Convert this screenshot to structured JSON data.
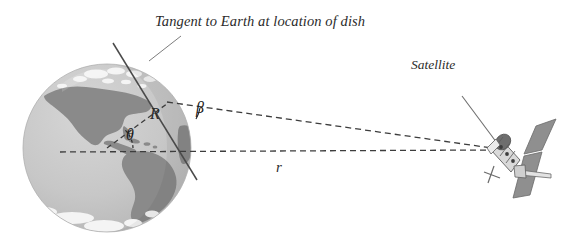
{
  "figure": {
    "kind": "geometry-diagram",
    "background_color": "#ffffff"
  },
  "labels": {
    "title": "Tangent to Earth at location of dish",
    "satellite": "Satellite",
    "angle_beta": "β",
    "angle_theta": "θ",
    "radius_R": "R",
    "distance_r": "r"
  },
  "colors": {
    "ocean": "#c9c9c9",
    "ocean_shade": "#bdbdbd",
    "land": "#8a8a8a",
    "ice": "#f2f2f2",
    "line": "#4a4a4a",
    "dashed": "#4a4a4a",
    "text": "#2b2b2b",
    "satellite_body": "#d8d8d8",
    "satellite_panel": "#8f8f8f",
    "satellite_dark": "#6e6e6e"
  },
  "geometry": {
    "earth_center": [
      107,
      148
    ],
    "earth_radius_px": 84,
    "dish_point": [
      168,
      103
    ],
    "satellite_point": [
      496,
      149
    ],
    "tangent_line": [
      [
        113,
        43
      ],
      [
        197,
        179
      ]
    ],
    "leader_line": [
      [
        150,
        60
      ],
      [
        180,
        37
      ]
    ],
    "horizontal_dashed": [
      [
        60,
        152
      ],
      [
        492,
        150
      ]
    ],
    "slant_dashed": [
      [
        168,
        103
      ],
      [
        492,
        148
      ]
    ],
    "radius_dashed": [
      [
        107,
        148
      ],
      [
        168,
        103
      ]
    ]
  },
  "elements": {
    "earth": "earth-globe",
    "satellite": "satellite-icon",
    "tangent": "tangent-line",
    "leader": "leader-line"
  }
}
